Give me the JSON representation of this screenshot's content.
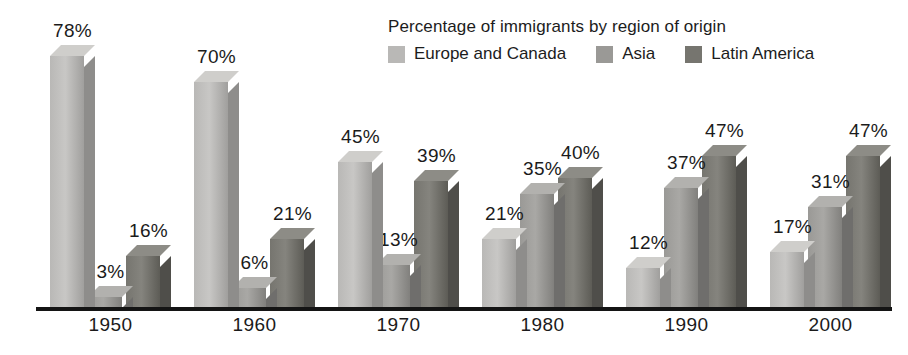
{
  "chart_data": {
    "type": "bar",
    "title": "Percentage of immigrants by region of origin",
    "xlabel": "",
    "ylabel": "",
    "ylim": [
      0,
      78
    ],
    "grid": true,
    "legend_position": "top-right",
    "categories": [
      "1950",
      "1960",
      "1970",
      "1980",
      "1990",
      "2000"
    ],
    "series": [
      {
        "name": "Europe and Canada",
        "color": "#b9b8b6",
        "side_color": "#8e8d8b",
        "top_color": "#cfcecb",
        "values": [
          78,
          70,
          45,
          21,
          12,
          17
        ],
        "labels": [
          "78%",
          "70%",
          "45%",
          "21%",
          "12%",
          "17%"
        ]
      },
      {
        "name": "Asia",
        "color": "#9a9996",
        "side_color": "#6f6e6c",
        "top_color": "#b2b1ae",
        "values": [
          3,
          6,
          13,
          35,
          37,
          31
        ],
        "labels": [
          "3%",
          "6%",
          "13%",
          "35%",
          "37%",
          "31%"
        ]
      },
      {
        "name": "Latin America",
        "color": "#76756f",
        "side_color": "#4f4e4a",
        "top_color": "#8d8c86",
        "values": [
          16,
          21,
          39,
          40,
          47,
          47
        ],
        "labels": [
          "16%",
          "21%",
          "39%",
          "40%",
          "47%",
          "47%"
        ]
      }
    ]
  },
  "axis": {
    "tick_labels": [
      "1950",
      "1960",
      "1970",
      "1980",
      "1990",
      "2000"
    ]
  },
  "legend": {
    "title": "Percentage of immigrants by region of origin",
    "entries": [
      {
        "label": "Europe and Canada",
        "color": "#b9b8b6"
      },
      {
        "label": "Asia",
        "color": "#9a9996"
      },
      {
        "label": "Latin America",
        "color": "#76756f"
      }
    ]
  },
  "colors": {
    "background": "#ffffff",
    "axis": "#141414",
    "text": "#1b1b1b",
    "gridline": "#ffffff"
  }
}
